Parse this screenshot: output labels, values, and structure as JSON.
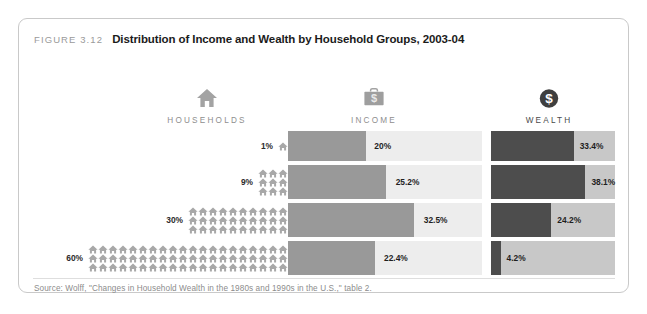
{
  "figure": {
    "number": "FIGURE 3.12",
    "title": "Distribution of Income and Wealth by Household Groups, 2003-04",
    "source": "Source: Wolff, \"Changes in Household Wealth in the 1980s and 1990s in the U.S.,\" table 2."
  },
  "columns": [
    {
      "label": "HOUSEHOLDS",
      "icon": "house-icon"
    },
    {
      "label": "INCOME",
      "icon": "briefcase-dollar-icon"
    },
    {
      "label": "WEALTH",
      "icon": "circle-dollar-icon"
    }
  ],
  "colors": {
    "income_fill": "#999999",
    "income_track": "#ededed",
    "wealth_fill": "#4d4d4d",
    "wealth_track": "#c8c8c8",
    "house_icon": "#a8a8a8",
    "frame_border": "#c9c9c9"
  },
  "rows": [
    {
      "households_label": "1%",
      "households_count": 1,
      "income_label": "20%",
      "wealth_label": "33.4%"
    },
    {
      "households_label": "9%",
      "households_count": 9,
      "income_label": "25.2%",
      "wealth_label": "38.1%"
    },
    {
      "households_label": "30%",
      "households_count": 30,
      "income_label": "32.5%",
      "wealth_label": "24.2%"
    },
    {
      "households_label": "60%",
      "households_count": 60,
      "income_label": "22.4%",
      "wealth_label": "4.2%"
    }
  ],
  "chart_data": {
    "type": "bar",
    "title": "Distribution of Income and Wealth by Household Groups, 2003-04",
    "xlabel": "",
    "ylabel": "Household group (share of all households)",
    "categories": [
      "1%",
      "9%",
      "30%",
      "60%"
    ],
    "series": [
      {
        "name": "HOUSEHOLDS",
        "values": [
          1,
          9,
          30,
          60
        ],
        "unit": "percent"
      },
      {
        "name": "INCOME",
        "values": [
          20,
          25.2,
          32.5,
          22.4
        ],
        "unit": "percent"
      },
      {
        "name": "WEALTH",
        "values": [
          33.4,
          38.1,
          24.2,
          4.2
        ],
        "unit": "percent"
      }
    ],
    "xlim": [
      0,
      50
    ],
    "grid": false,
    "legend": "none",
    "orientation": "horizontal"
  }
}
